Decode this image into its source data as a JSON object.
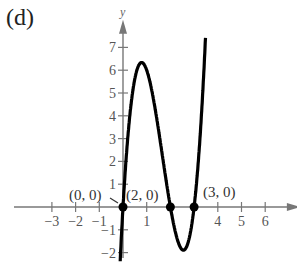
{
  "panel_label": "(d)",
  "chart_data": {
    "type": "line",
    "title": "",
    "function": "y = 3x^3 - 15x^2 + 18x",
    "xlabel": "x",
    "ylabel": "y",
    "xlim": [
      -3.2,
      7
    ],
    "ylim": [
      -2.4,
      7.6
    ],
    "x_ticks": [
      -3,
      -2,
      -1,
      1,
      4,
      5,
      6
    ],
    "y_ticks": [
      -2,
      -1,
      1,
      2,
      3,
      4,
      5,
      6,
      7
    ],
    "grid": false,
    "points": [
      {
        "x": 0,
        "y": 0,
        "label": "(0, 0)"
      },
      {
        "x": 2,
        "y": 0,
        "label": "(2, 0)"
      },
      {
        "x": 3,
        "y": 0,
        "label": "(3, 0)"
      }
    ],
    "approx_extrema": [
      {
        "x": 0.78,
        "y": 6.3,
        "kind": "max"
      },
      {
        "x": 2.55,
        "y": -1.9,
        "kind": "min"
      }
    ]
  }
}
